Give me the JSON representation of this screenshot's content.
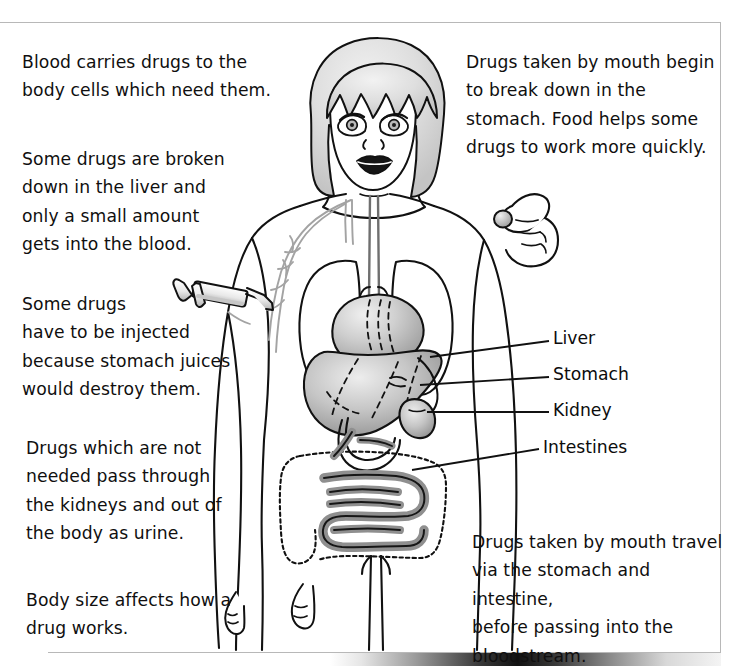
{
  "page": {
    "background_color": "#ffffff",
    "rule_color": "#b8b8b8",
    "text_color": "#100f0f"
  },
  "captions": [
    {
      "id": "blood-carries",
      "text": "Blood carries drugs to the\nbody cells which need them.",
      "x": 22,
      "y": 48
    },
    {
      "id": "broken-down-liver",
      "text": "Some drugs are broken\ndown in the liver and\nonly a small amount\ngets into the blood.",
      "x": 22,
      "y": 145
    },
    {
      "id": "injected",
      "text": "Some drugs\nhave to be injected\nbecause stomach juices\nwould destroy them.",
      "x": 22,
      "y": 290
    },
    {
      "id": "kidneys-urine",
      "text": "Drugs which are not\nneeded pass through\nthe kidneys and out of\nthe body as urine.",
      "x": 26,
      "y": 434
    },
    {
      "id": "body-size",
      "text": "Body size affects how a\ndrug works.",
      "x": 26,
      "y": 586
    },
    {
      "id": "mouth-stomach",
      "text": "Drugs taken by mouth begin\nto break down in the\nstomach. Food helps some\n drugs to work more quickly.",
      "x": 466,
      "y": 48
    },
    {
      "id": "mouth-travel",
      "text": "Drugs taken by mouth travel\nvia the stomach and intestine,\nbefore passing into the\nbloodstream.",
      "x": 472,
      "y": 528
    }
  ],
  "organ_labels": [
    {
      "id": "liver",
      "text": "Liver",
      "x": 553,
      "y": 328,
      "leader": {
        "x1": 549,
        "y1": 341,
        "x2": 430,
        "y2": 357
      }
    },
    {
      "id": "stomach",
      "text": "Stomach",
      "x": 553,
      "y": 364,
      "leader": {
        "x1": 549,
        "y1": 377,
        "x2": 420,
        "y2": 385
      }
    },
    {
      "id": "kidney",
      "text": "Kidney",
      "x": 553,
      "y": 400,
      "leader": {
        "x1": 549,
        "y1": 412,
        "x2": 427,
        "y2": 412
      }
    },
    {
      "id": "intestines",
      "text": "Intestines",
      "x": 543,
      "y": 437,
      "leader": {
        "x1": 539,
        "y1": 449,
        "x2": 412,
        "y2": 470
      }
    }
  ],
  "figure": {
    "parts": [
      "head-and-hair",
      "face-eyes",
      "face-nose",
      "face-mouth",
      "neck",
      "torso-outline",
      "left-arm",
      "right-arm",
      "right-hand-holding-pill",
      "legs",
      "lungs",
      "oesophagus",
      "stomach",
      "liver",
      "kidney",
      "small-intestine",
      "large-intestine",
      "blood-vessels",
      "syringe"
    ],
    "colors": {
      "outline": "#111111",
      "organ_light": "#d9d9d9",
      "organ_mid": "#bdbdbd",
      "organ_dark": "#9a9a9a",
      "hair": "#dcdcdc",
      "vessel": "#a6a6a6",
      "intestine_fill": "#a9a9a9"
    }
  }
}
